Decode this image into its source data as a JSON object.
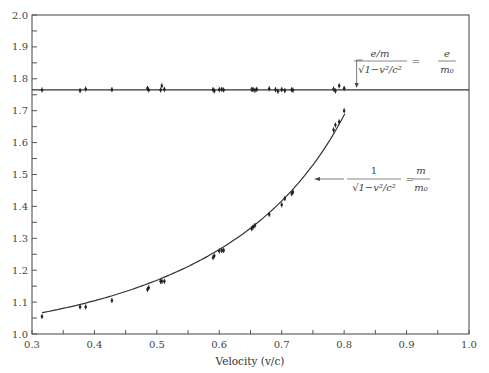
{
  "chart_data": {
    "type": "scatter",
    "title": "",
    "xlabel": "Velocity (v/c)",
    "ylabel": "",
    "xlim": [
      0.3,
      1.0
    ],
    "ylim": [
      1.0,
      2.0
    ],
    "x_ticks": [
      "0.3",
      "0.4",
      "0.5",
      "0.6",
      "0.7",
      "0.8",
      "0.9",
      "1.0"
    ],
    "y_ticks": [
      "1.0",
      "1.1",
      "1.2",
      "1.3",
      "1.4",
      "1.5",
      "1.6",
      "1.7",
      "1.8",
      "1.9",
      "2.0"
    ],
    "grid": false,
    "legend": null,
    "series": [
      {
        "name": "e/m / sqrt(1 - v^2/c^2) = e/m0",
        "kind": "scatter_with_fit_line",
        "fit_line_y": 1.765,
        "x": [
          0.316,
          0.377,
          0.386,
          0.428,
          0.485,
          0.487,
          0.506,
          0.508,
          0.512,
          0.59,
          0.592,
          0.6,
          0.604,
          0.607,
          0.652,
          0.654,
          0.657,
          0.66,
          0.68,
          0.69,
          0.694,
          0.7,
          0.705,
          0.716,
          0.718,
          0.783,
          0.786,
          0.792,
          0.8
        ],
        "y": [
          1.765,
          1.763,
          1.768,
          1.766,
          1.77,
          1.765,
          1.765,
          1.778,
          1.767,
          1.766,
          1.762,
          1.766,
          1.767,
          1.765,
          1.767,
          1.766,
          1.764,
          1.767,
          1.769,
          1.766,
          1.761,
          1.766,
          1.763,
          1.766,
          1.764,
          1.768,
          1.762,
          1.778,
          1.77
        ]
      },
      {
        "name": "1 / sqrt(1 - v^2/c^2) = m/m0",
        "kind": "scatter_with_theory_curve",
        "x": [
          0.316,
          0.377,
          0.386,
          0.428,
          0.485,
          0.487,
          0.506,
          0.508,
          0.512,
          0.59,
          0.592,
          0.6,
          0.604,
          0.607,
          0.652,
          0.654,
          0.657,
          0.68,
          0.7,
          0.705,
          0.716,
          0.718,
          0.783,
          0.786,
          0.792,
          0.8
        ],
        "y": [
          1.055,
          1.085,
          1.085,
          1.105,
          1.14,
          1.145,
          1.165,
          1.165,
          1.165,
          1.24,
          1.245,
          1.26,
          1.262,
          1.262,
          1.33,
          1.335,
          1.34,
          1.375,
          1.405,
          1.425,
          1.44,
          1.445,
          1.64,
          1.655,
          1.665,
          1.7
        ]
      }
    ],
    "annotations": [
      {
        "text": "e/m / √(1−v²/c²) = e/m₀",
        "num": "e/m",
        "den": "√1−v²/c²",
        "rhs_num": "e",
        "rhs_den": "m₀",
        "points_to": [
          0.82,
          1.765
        ]
      },
      {
        "text": "1 / √(1−v²/c²) = m/m₀",
        "num": "1",
        "den": "√1−v²/c²",
        "rhs_num": "m",
        "rhs_den": "m₀",
        "points_to": [
          0.74,
          1.45
        ]
      }
    ]
  }
}
